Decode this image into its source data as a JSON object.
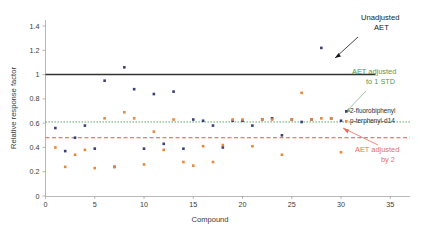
{
  "chart_data": {
    "type": "scatter",
    "title": "",
    "xlabel": "Compound",
    "ylabel": "Relative response factor",
    "xlim": [
      0,
      37
    ],
    "ylim": [
      0,
      1.45
    ],
    "xticks": [
      "0",
      "5",
      "10",
      "15",
      "20",
      "25",
      "30",
      "35"
    ],
    "xtick_values": [
      0,
      5,
      10,
      15,
      20,
      25,
      30,
      35
    ],
    "yticks": [
      "0",
      "0.2",
      "0.4",
      "0.6",
      "0.8",
      "1",
      "1.2",
      "1.4"
    ],
    "ytick_values": [
      0,
      0.2,
      0.4,
      0.6,
      0.8,
      1,
      1.2,
      1.4
    ],
    "grid": false,
    "legend_position": "right",
    "series": [
      {
        "name": "2-fluorobiphenyl",
        "color": "#3b3f7a",
        "marker": "square",
        "points": [
          {
            "x": 1,
            "y": 0.56
          },
          {
            "x": 2,
            "y": 0.37
          },
          {
            "x": 3,
            "y": 0.48
          },
          {
            "x": 4,
            "y": 0.58
          },
          {
            "x": 5,
            "y": 0.39
          },
          {
            "x": 6,
            "y": 0.95
          },
          {
            "x": 7,
            "y": 0.24
          },
          {
            "x": 8,
            "y": 1.06
          },
          {
            "x": 9,
            "y": 0.88
          },
          {
            "x": 10,
            "y": 0.39
          },
          {
            "x": 11,
            "y": 0.84
          },
          {
            "x": 12,
            "y": 0.43
          },
          {
            "x": 13,
            "y": 0.86
          },
          {
            "x": 14,
            "y": 0.39
          },
          {
            "x": 15,
            "y": 0.63
          },
          {
            "x": 16,
            "y": 0.62
          },
          {
            "x": 17,
            "y": 0.58
          },
          {
            "x": 18,
            "y": 0.4
          },
          {
            "x": 19,
            "y": 0.62
          },
          {
            "x": 20,
            "y": 0.62
          },
          {
            "x": 21,
            "y": 0.58
          },
          {
            "x": 22,
            "y": 0.63
          },
          {
            "x": 23,
            "y": 0.64
          },
          {
            "x": 24,
            "y": 0.5
          },
          {
            "x": 25,
            "y": 0.63
          },
          {
            "x": 26,
            "y": 0.61
          },
          {
            "x": 27,
            "y": 0.63
          },
          {
            "x": 28,
            "y": 1.22
          },
          {
            "x": 29,
            "y": 0.64
          },
          {
            "x": 30,
            "y": 0.62
          }
        ]
      },
      {
        "name": "p-terphenyl-d14",
        "color": "#e8883a",
        "marker": "square",
        "points": [
          {
            "x": 1,
            "y": 0.4
          },
          {
            "x": 2,
            "y": 0.24
          },
          {
            "x": 3,
            "y": 0.34
          },
          {
            "x": 4,
            "y": 0.38
          },
          {
            "x": 5,
            "y": 0.23
          },
          {
            "x": 6,
            "y": 0.64
          },
          {
            "x": 7,
            "y": 0.24
          },
          {
            "x": 8,
            "y": 0.69
          },
          {
            "x": 9,
            "y": 0.64
          },
          {
            "x": 10,
            "y": 0.26
          },
          {
            "x": 11,
            "y": 0.53
          },
          {
            "x": 12,
            "y": 0.38
          },
          {
            "x": 13,
            "y": 0.63
          },
          {
            "x": 14,
            "y": 0.28
          },
          {
            "x": 15,
            "y": 0.25
          },
          {
            "x": 16,
            "y": 0.41
          },
          {
            "x": 17,
            "y": 0.28
          },
          {
            "x": 18,
            "y": 0.42
          },
          {
            "x": 19,
            "y": 0.63
          },
          {
            "x": 20,
            "y": 0.63
          },
          {
            "x": 21,
            "y": 0.41
          },
          {
            "x": 22,
            "y": 0.63
          },
          {
            "x": 23,
            "y": 0.63
          },
          {
            "x": 24,
            "y": 0.34
          },
          {
            "x": 25,
            "y": 0.63
          },
          {
            "x": 26,
            "y": 0.85
          },
          {
            "x": 27,
            "y": 0.63
          },
          {
            "x": 28,
            "y": 0.64
          },
          {
            "x": 29,
            "y": 0.64
          },
          {
            "x": 30,
            "y": 0.36
          }
        ]
      }
    ],
    "reference_lines": [
      {
        "name": "unadjusted-aet",
        "y": 1.0,
        "color": "#333333",
        "style": "solid",
        "x_end": 33.5
      },
      {
        "name": "aet-adjusted-1-std",
        "y": 0.61,
        "color": "#4f9c54",
        "style": "dotted",
        "x_end": 37
      },
      {
        "name": "aet-adjusted-by-2",
        "y": 0.48,
        "color": "#e05a44",
        "style": "dashed",
        "x_end": 37
      }
    ],
    "annotations": [
      {
        "name": "unadjusted-aet",
        "lines": [
          "Unadjusted",
          "AET"
        ],
        "color": "#1a1a1a"
      },
      {
        "name": "aet-adjusted-1-std",
        "lines": [
          "AET adjusted",
          "to 1 STD"
        ],
        "color": "#4f9c54"
      },
      {
        "name": "aet-adjusted-by-2",
        "lines": [
          "AET adjusted",
          "by 2"
        ],
        "color": "#e8705a"
      }
    ]
  }
}
